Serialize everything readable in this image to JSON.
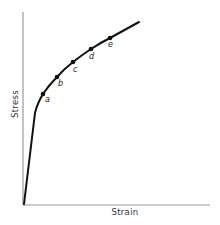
{
  "diagram": {
    "type": "stress-strain-curve",
    "axes": {
      "x_label": "Strain",
      "y_label": "Stress",
      "color": "#9a9a9a"
    },
    "curve": {
      "color": "#111111",
      "description": "Linear elastic region from origin, then yielding knee and strain-hardening curve"
    },
    "points": [
      {
        "label": "a"
      },
      {
        "label": "b"
      },
      {
        "label": "c"
      },
      {
        "label": "d"
      },
      {
        "label": "e"
      }
    ]
  }
}
